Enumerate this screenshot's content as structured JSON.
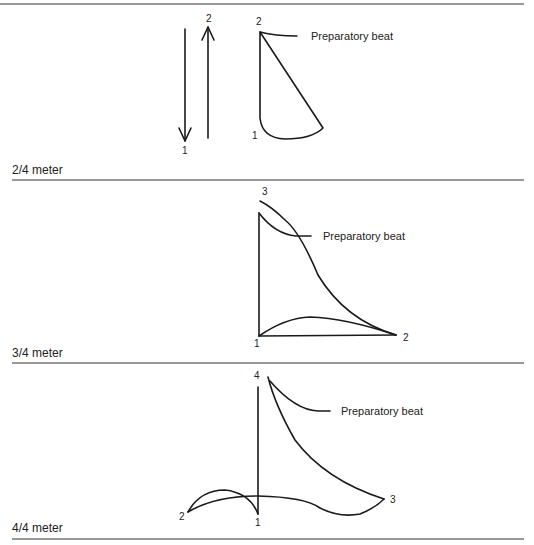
{
  "panels": [
    {
      "meter_label": "2/4 meter",
      "beat_labels": {
        "arrow_down": "1",
        "arrow_up": "2",
        "top": "2",
        "bottom": "1"
      },
      "preparatory_label": "Preparatory beat"
    },
    {
      "meter_label": "3/4 meter",
      "beat_labels": {
        "top": "3",
        "bottom_left": "1",
        "bottom_right": "2"
      },
      "preparatory_label": "Preparatory beat"
    },
    {
      "meter_label": "4/4 meter",
      "beat_labels": {
        "top": "4",
        "left": "2",
        "center": "1",
        "right": "3"
      },
      "preparatory_label": "Preparatory beat"
    }
  ],
  "colors": {
    "ink": "#1a1a1a",
    "background": "#ffffff"
  }
}
